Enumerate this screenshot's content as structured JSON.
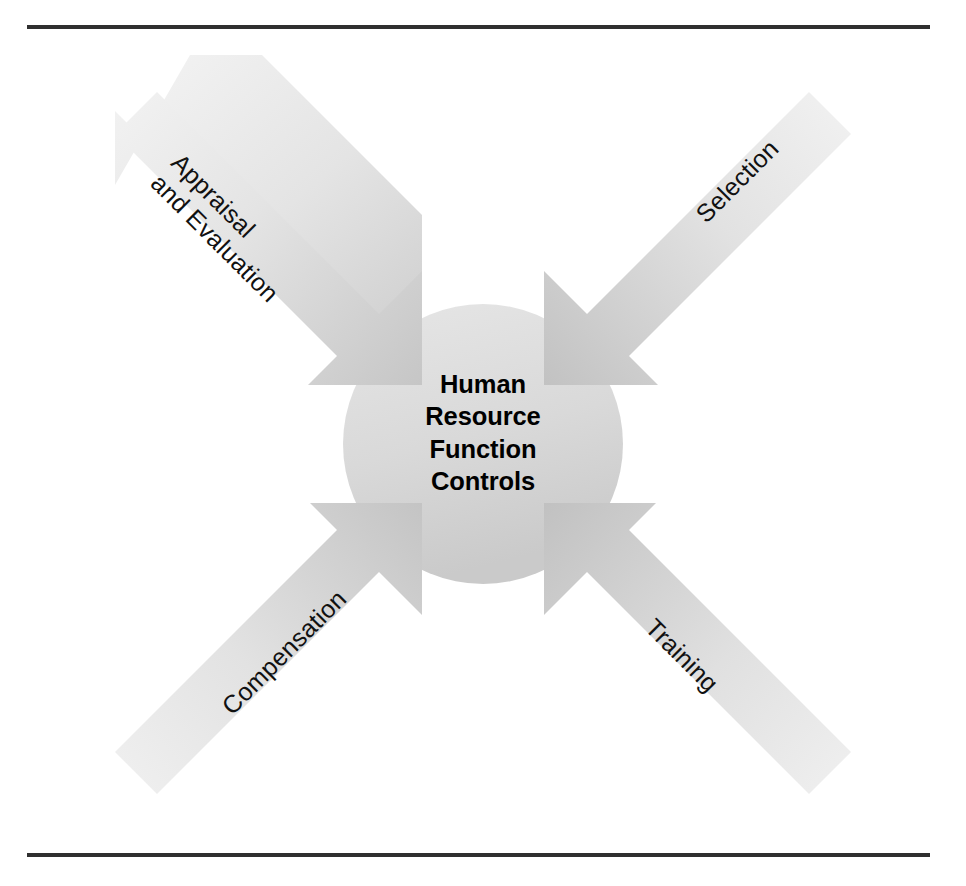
{
  "figure": {
    "kind": "converging-arrows-diagram",
    "center": {
      "shape": "circle",
      "lines": [
        "Human",
        "Resource",
        "Function",
        "Controls"
      ],
      "full_text": "Human Resource Function Controls"
    },
    "arrows": [
      {
        "id": "appraisal-and-evaluation",
        "position": "top-left",
        "direction": "points-down-right-toward-center",
        "lines": [
          "Appraisal",
          "and Evaluation"
        ],
        "label": "Appraisal and Evaluation"
      },
      {
        "id": "selection",
        "position": "top-right",
        "direction": "points-down-left-toward-center",
        "lines": [
          "Selection"
        ],
        "label": "Selection"
      },
      {
        "id": "compensation",
        "position": "bottom-left",
        "direction": "points-up-right-toward-center",
        "lines": [
          "Compensation"
        ],
        "label": "Compensation"
      },
      {
        "id": "training",
        "position": "bottom-right",
        "direction": "points-up-left-toward-center",
        "lines": [
          "Training"
        ],
        "label": "Training"
      }
    ],
    "rules": {
      "top": "horizontal-rule",
      "bottom": "horizontal-rule"
    }
  },
  "colors": {
    "page_background": "#ffffff",
    "rule": "#2f2f2f",
    "arrow_light": "#f0f0f0",
    "arrow_mid": "#dddddd",
    "arrow_dark": "#c8c8c8",
    "center_fill_light": "#e3e3e3",
    "center_fill_dark": "#cfcfcf",
    "text": "#111111",
    "center_text": "#000000"
  }
}
